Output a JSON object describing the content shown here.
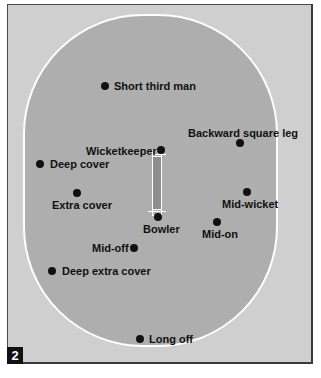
{
  "figure_number": "2",
  "colors": {
    "outfield": "#cfcfcf",
    "field": "#aeaeae",
    "boundary": "#ffffff",
    "pitch": "#8e8e8e",
    "dot": "#111111"
  },
  "fielders": [
    {
      "name": "Short third man",
      "dot": [
        105,
        86
      ],
      "label": [
        114,
        80
      ]
    },
    {
      "name": "Backward square leg",
      "dot": [
        240,
        143
      ],
      "label": [
        188,
        127
      ]
    },
    {
      "name": "Wicketkeeper",
      "dot": [
        161,
        150
      ],
      "label": [
        86,
        145
      ]
    },
    {
      "name": "Deep cover",
      "dot": [
        40,
        164
      ],
      "label": [
        50,
        158
      ]
    },
    {
      "name": "Mid-wicket",
      "dot": [
        247,
        192
      ],
      "label": [
        222,
        198
      ]
    },
    {
      "name": "Extra cover",
      "dot": [
        77,
        193
      ],
      "label": [
        52,
        199
      ]
    },
    {
      "name": "Mid-on",
      "dot": [
        217,
        222
      ],
      "label": [
        202,
        228
      ]
    },
    {
      "name": "Bowler",
      "dot": [
        158,
        217
      ],
      "label": [
        143,
        223
      ]
    },
    {
      "name": "Mid-off",
      "dot": [
        134,
        248
      ],
      "label": [
        92,
        242
      ]
    },
    {
      "name": "Deep extra cover",
      "dot": [
        52,
        271
      ],
      "label": [
        62,
        265
      ]
    },
    {
      "name": "Long off",
      "dot": [
        140,
        339
      ],
      "label": [
        149,
        333
      ]
    }
  ]
}
